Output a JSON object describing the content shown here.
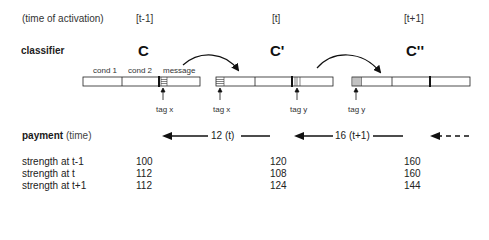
{
  "header": {
    "activation_label": "(time of activation)",
    "times": [
      "[t-1]",
      "[t]",
      "[t+1]"
    ]
  },
  "classifier": {
    "label": "classifier",
    "names": [
      "C",
      "C'",
      "C''"
    ],
    "segments": {
      "cond1": "cond 1",
      "cond2": "cond 2",
      "message": "message"
    },
    "tags": [
      "tag x",
      "tag x",
      "tag y",
      "tag y"
    ]
  },
  "payment": {
    "label_bold": "payment",
    "label_rest": " (time)",
    "arrows": [
      {
        "label": "12 (t)",
        "style": "solid"
      },
      {
        "label": "16 (t+1)",
        "style": "solid"
      },
      {
        "label": "",
        "style": "dashed"
      }
    ]
  },
  "strength": {
    "rows": [
      {
        "label": "strength at t-1",
        "values": [
          "100",
          "120",
          "160"
        ]
      },
      {
        "label": "strength at t",
        "values": [
          "112",
          "108",
          "160"
        ]
      },
      {
        "label": "strength at t+1",
        "values": [
          "112",
          "124",
          "144"
        ]
      }
    ]
  }
}
